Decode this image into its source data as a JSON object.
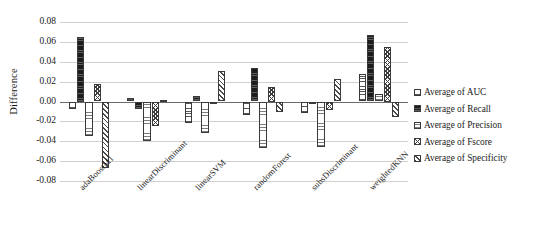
{
  "chart_data": {
    "type": "bar",
    "title": "",
    "xlabel": "",
    "ylabel": "Difference",
    "ylim": [
      -0.08,
      0.08
    ],
    "ytick_labels": [
      "0.08",
      "0.06",
      "0.04",
      "0.02",
      "0.00",
      "-0.02",
      "-0.04",
      "-0.06",
      "-0.08"
    ],
    "ytick_values": [
      0.08,
      0.06,
      0.04,
      0.02,
      0.0,
      -0.02,
      -0.04,
      -0.06,
      -0.08
    ],
    "grid": true,
    "legend_position": "right",
    "categories": [
      "adaBoostM1",
      "linearDiscriminant",
      "linearSVM",
      "randomForest",
      "subsDiscriminant",
      "weightedKNN"
    ],
    "series": [
      {
        "name": "Average of AUC",
        "pattern": "horizontal-line-light",
        "values": [
          -0.008,
          0.004,
          -0.022,
          -0.014,
          -0.012,
          0.028
        ]
      },
      {
        "name": "Average of Recall",
        "pattern": "solid-black",
        "values": [
          0.065,
          -0.008,
          0.006,
          0.034,
          -0.001,
          0.067
        ]
      },
      {
        "name": "Average of Precision",
        "pattern": "horizontal-dotted",
        "values": [
          -0.035,
          -0.04,
          -0.032,
          -0.047,
          -0.046,
          0.008
        ]
      },
      {
        "name": "Average of Fscore",
        "pattern": "cross-hatch",
        "values": [
          0.018,
          -0.025,
          -0.002,
          0.015,
          -0.009,
          0.055
        ]
      },
      {
        "name": "Average of Specificity",
        "pattern": "diagonal-hatch",
        "values": [
          -0.067,
          0.002,
          0.031,
          -0.011,
          0.023,
          -0.016
        ]
      }
    ]
  }
}
